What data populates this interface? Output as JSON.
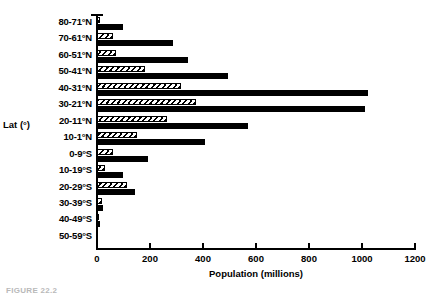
{
  "chart_data": {
    "type": "bar",
    "orientation": "horizontal",
    "title": "",
    "xlabel": "Population (millions)",
    "ylabel": "Lat (°)",
    "xlim": [
      0,
      1200
    ],
    "xticks": [
      0,
      200,
      400,
      600,
      800,
      1000,
      1200
    ],
    "xtick_labels": [
      "0",
      "200",
      "400",
      "600",
      "800",
      "1000",
      "1200"
    ],
    "grid": false,
    "legend": "none",
    "categories": [
      "80-71°N",
      "70-61°N",
      "60-51°N",
      "50-41°N",
      "40-31°N",
      "30-21°N",
      "20-11°N",
      "10-1°N",
      "0-9°S",
      "10-19°S",
      "20-29°S",
      "30-39°S",
      "40-49°S",
      "50-59°S"
    ],
    "series": [
      {
        "name": "hatched",
        "pattern": "diagonal-hatch",
        "color": "#000000",
        "values": [
          10,
          60,
          72,
          180,
          317,
          374,
          264,
          151,
          60,
          30,
          113,
          18,
          8,
          0
        ]
      },
      {
        "name": "solid",
        "pattern": "solid",
        "color": "#000000",
        "values": [
          98,
          287,
          343,
          495,
          1022,
          1011,
          570,
          407,
          192,
          98,
          143,
          22,
          10,
          0
        ]
      }
    ]
  },
  "figure": {
    "caption": "FIGURE 22.2"
  }
}
